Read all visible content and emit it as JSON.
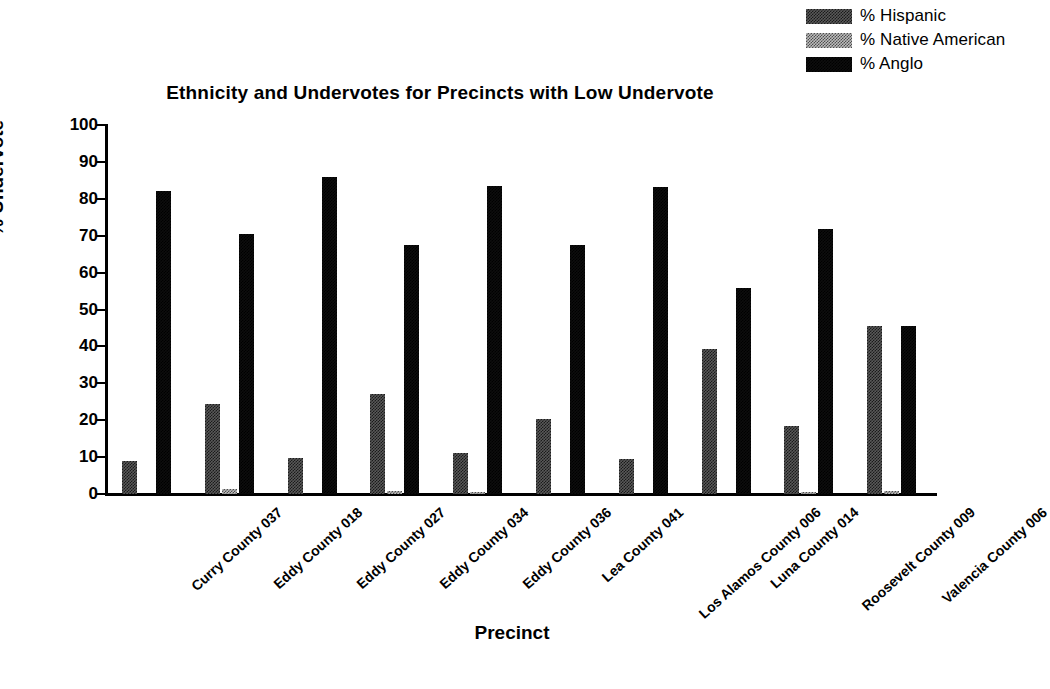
{
  "chart_data": {
    "type": "bar",
    "title": "Ethnicity and Undervotes for Precincts with Low Undervote",
    "xlabel": "Precinct",
    "ylabel": "% Undervote",
    "ylim": [
      0,
      100
    ],
    "yticks": [
      0,
      10,
      20,
      30,
      40,
      50,
      60,
      70,
      80,
      90,
      100
    ],
    "grid": false,
    "legend_position": "top-right",
    "categories": [
      "Curry County 037",
      "Eddy County 018",
      "Eddy County 027",
      "Eddy County 034",
      "Eddy County 036",
      "Lea County 041",
      "Los Alamos County 006",
      "Luna County 014",
      "Roosevelt County 009",
      "Valencia County 006"
    ],
    "series": [
      {
        "name": "% Hispanic",
        "fill": "fill-hispanic",
        "color": "#404040",
        "values": [
          9.0,
          24.5,
          9.8,
          27.0,
          11.0,
          20.2,
          9.5,
          39.2,
          18.5,
          45.5
        ]
      },
      {
        "name": "% Native American",
        "fill": "fill-native",
        "color": "#bdbdbd",
        "values": [
          0.0,
          1.4,
          0.0,
          0.8,
          0.6,
          0.0,
          0.0,
          0.0,
          0.6,
          0.8
        ]
      },
      {
        "name": "% Anglo",
        "fill": "fill-anglo",
        "color": "#0d0d0d",
        "values": [
          82.0,
          70.6,
          85.8,
          67.6,
          83.6,
          67.6,
          83.2,
          55.8,
          71.8,
          45.5
        ]
      }
    ]
  }
}
